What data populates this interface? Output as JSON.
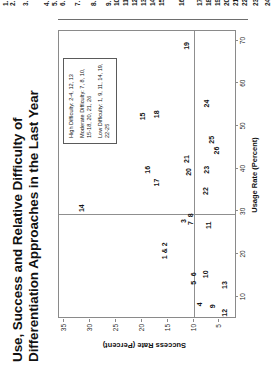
{
  "clipped_list": {
    "note": "partially cut-off numbered list at top edge",
    "numbers": [
      "1.",
      "2.",
      "3.",
      "4.",
      "5.",
      "6.",
      "7.",
      "8.",
      "9.",
      "10.",
      "11.",
      "12.",
      "13.",
      "14.",
      "15.",
      "16.",
      "17.",
      "18.",
      "19.",
      "20.",
      "21.",
      "22.",
      "23.",
      "24."
    ]
  },
  "title": {
    "line1": "Use, Success and Relative Difficulty of",
    "line2": "Differentiation Approaches in the Last Year"
  },
  "legend": {
    "groups": [
      {
        "label": "High Difficulty: 2-4, 12, 13"
      },
      {
        "label": "Moderate Difficulty: 7, 8, 10,",
        "label2": "15-18, 20, 21, 26"
      },
      {
        "label": "Low Difficulty: 1, 9, 11, 14, 19,",
        "label2": "22-25"
      }
    ]
  },
  "chart_data": {
    "type": "scatter",
    "title": "Use, Success and Relative Difficulty of Differentiation Approaches in the Last Year",
    "xlabel": "Usage Rate (Percent)",
    "ylabel": "Success Rate (Percent)",
    "xlim": [
      5,
      72
    ],
    "ylim": [
      2,
      36
    ],
    "xticks": [
      10,
      20,
      30,
      40,
      50,
      60,
      70
    ],
    "yticks": [
      5,
      10,
      15,
      20,
      25,
      30,
      35
    ],
    "grid": false,
    "legend_position": "top-right",
    "reference_lines": {
      "vertical_x": 29,
      "horizontal_y": 10
    },
    "points": [
      {
        "label": "1 & 2",
        "x": 20.5,
        "y": 15.8
      },
      {
        "label": "3",
        "x": 27.5,
        "y": 12.0
      },
      {
        "label": "4",
        "x": 8.0,
        "y": 9.0
      },
      {
        "label": "5",
        "x": 13.0,
        "y": 10.2
      },
      {
        "label": "6",
        "x": 15.0,
        "y": 10.2
      },
      {
        "label": "7",
        "x": 27.0,
        "y": 10.6
      },
      {
        "label": "8",
        "x": 28.8,
        "y": 10.6
      },
      {
        "label": "9",
        "x": 7.5,
        "y": 6.5
      },
      {
        "label": "10",
        "x": 15.0,
        "y": 7.8
      },
      {
        "label": "11",
        "x": 26.5,
        "y": 7.3
      },
      {
        "label": "12",
        "x": 6.0,
        "y": 4.2
      },
      {
        "label": "13",
        "x": 12.5,
        "y": 4.2
      },
      {
        "label": "14",
        "x": 30.5,
        "y": 31.8
      },
      {
        "label": "15",
        "x": 52.0,
        "y": 20.0
      },
      {
        "label": "16",
        "x": 39.5,
        "y": 19.0
      },
      {
        "label": "17",
        "x": 36.5,
        "y": 17.2
      },
      {
        "label": "18",
        "x": 52.5,
        "y": 17.2
      },
      {
        "label": "19",
        "x": 68.5,
        "y": 11.5
      },
      {
        "label": "20",
        "x": 39.0,
        "y": 11.0
      },
      {
        "label": "21",
        "x": 42.0,
        "y": 11.5
      },
      {
        "label": "22",
        "x": 34.5,
        "y": 7.8
      },
      {
        "label": "23",
        "x": 39.5,
        "y": 7.6
      },
      {
        "label": "24",
        "x": 55.0,
        "y": 7.6
      },
      {
        "label": "25",
        "x": 46.5,
        "y": 6.6
      },
      {
        "label": "26",
        "x": 44.0,
        "y": 5.6
      }
    ]
  }
}
